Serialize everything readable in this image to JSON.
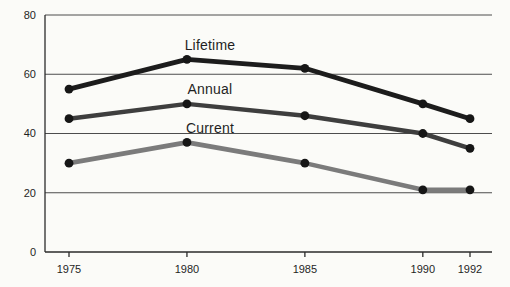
{
  "figure": {
    "background_color": "#fbfbf8",
    "text_color": "#1f1f1f",
    "gridline_color": "#4d4d4d",
    "axis_color": "#2b2b2b",
    "point_color": "#161616"
  },
  "chart_data": {
    "type": "line",
    "title": "",
    "xlabel": "",
    "ylabel": "",
    "x": [
      1975,
      1980,
      1985,
      1990,
      1992
    ],
    "x_tick_labels": [
      "1975",
      "1980",
      "1985",
      "1990",
      "1992"
    ],
    "y_ticks": [
      0,
      20,
      40,
      60,
      80
    ],
    "y_tick_labels": [
      "0",
      "20",
      "40",
      "60",
      "80"
    ],
    "ylim": [
      0,
      80
    ],
    "grid": "horizontal",
    "legend_position": "inline-labels-above-1980-points",
    "markers": "filled-circle",
    "series": [
      {
        "name": "Lifetime",
        "values": [
          55,
          65,
          62,
          50,
          45
        ],
        "color": "#1c1c1c",
        "stroke_width": 4.8
      },
      {
        "name": "Annual",
        "values": [
          45,
          50,
          46,
          40,
          35
        ],
        "color": "#3e3e3e",
        "stroke_width": 4.5
      },
      {
        "name": "Current",
        "values": [
          30,
          37,
          30,
          21,
          21
        ],
        "color": "#7b7b7b",
        "stroke_width": 4.6
      }
    ]
  }
}
